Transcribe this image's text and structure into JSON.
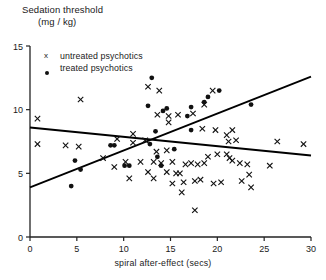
{
  "chart_data": {
    "type": "scatter",
    "title": "Sedation threshold (mg / kg)",
    "title_line1": "Sedation threshold",
    "title_line2": "(mg / kg)",
    "ylabel": "Sedation threshold (mg / kg)",
    "xlabel": "spiral after-effect (secs)",
    "xlim": [
      0,
      30
    ],
    "ylim": [
      0,
      15
    ],
    "xticks": [
      0,
      5,
      10,
      15,
      20,
      25,
      30
    ],
    "yticks": [
      0,
      5,
      10,
      15
    ],
    "xticklabels": [
      "0",
      "5",
      "10",
      "15",
      "20",
      "25",
      "30"
    ],
    "yticklabels": [
      "0",
      "5",
      "10",
      "15"
    ],
    "grid": false,
    "legend_position": "upper-left",
    "marker_color": "#111111",
    "line_color": "#000000",
    "series": [
      {
        "name": "untreated psychotics",
        "marker": "x",
        "points": [
          [
            0.8,
            9.3
          ],
          [
            0.8,
            7.3
          ],
          [
            5.4,
            10.8
          ],
          [
            3.8,
            7.2
          ],
          [
            5.2,
            7.1
          ],
          [
            9.3,
            7.7
          ],
          [
            11.0,
            8.1
          ],
          [
            11.0,
            7.4
          ],
          [
            7.8,
            6.2
          ],
          [
            9.0,
            5.5
          ],
          [
            12.6,
            11.8
          ],
          [
            13.8,
            11.5
          ],
          [
            13.6,
            9.6
          ],
          [
            14.8,
            9.5
          ],
          [
            14.8,
            9.0
          ],
          [
            15.8,
            9.6
          ],
          [
            17.4,
            9.7
          ],
          [
            18.6,
            10.4
          ],
          [
            19.5,
            11.5
          ],
          [
            18.4,
            8.5
          ],
          [
            12.3,
            7.6
          ],
          [
            13.5,
            6.7
          ],
          [
            14.6,
            6.8
          ],
          [
            13.2,
            5.9
          ],
          [
            14.0,
            5.8
          ],
          [
            15.2,
            5.9
          ],
          [
            16.6,
            5.7
          ],
          [
            17.2,
            5.8
          ],
          [
            17.9,
            5.7
          ],
          [
            18.6,
            5.8
          ],
          [
            19.8,
            8.4
          ],
          [
            21.0,
            8.0
          ],
          [
            21.6,
            8.4
          ],
          [
            21.2,
            7.5
          ],
          [
            22.0,
            7.6
          ],
          [
            21.0,
            6.5
          ],
          [
            21.3,
            6.2
          ],
          [
            21.6,
            6.0
          ],
          [
            22.4,
            5.8
          ],
          [
            20.0,
            6.5
          ],
          [
            19.0,
            6.3
          ],
          [
            23.2,
            5.7
          ],
          [
            25.6,
            5.6
          ],
          [
            26.4,
            7.5
          ],
          [
            29.2,
            7.3
          ],
          [
            10.6,
            4.6
          ],
          [
            13.2,
            4.6
          ],
          [
            15.2,
            4.2
          ],
          [
            16.4,
            4.3
          ],
          [
            17.6,
            4.4
          ],
          [
            16.2,
            3.5
          ],
          [
            18.2,
            4.5
          ],
          [
            19.6,
            4.2
          ],
          [
            16.0,
            5.0
          ],
          [
            23.4,
            4.9
          ],
          [
            23.6,
            3.9
          ],
          [
            17.6,
            2.1
          ],
          [
            20.4,
            4.3
          ],
          [
            22.6,
            4.4
          ],
          [
            14.6,
            5.1
          ],
          [
            15.6,
            5.0
          ],
          [
            11.8,
            5.9
          ],
          [
            12.6,
            5.1
          ],
          [
            10.2,
            5.9
          ]
        ]
      },
      {
        "name": "treated psychotics",
        "marker": "o",
        "points": [
          [
            4.8,
            6.0
          ],
          [
            5.4,
            5.3
          ],
          [
            8.6,
            7.2
          ],
          [
            12.6,
            10.3
          ],
          [
            13.0,
            12.5
          ],
          [
            14.2,
            9.9
          ],
          [
            14.6,
            10.1
          ],
          [
            16.8,
            9.5
          ],
          [
            17.2,
            10.2
          ],
          [
            18.6,
            10.6
          ],
          [
            19.0,
            11.0
          ],
          [
            20.2,
            11.5
          ],
          [
            17.2,
            8.4
          ],
          [
            13.4,
            8.3
          ],
          [
            12.8,
            7.3
          ],
          [
            9.0,
            7.2
          ],
          [
            15.4,
            6.9
          ],
          [
            13.6,
            6.3
          ],
          [
            14.0,
            5.6
          ],
          [
            10.1,
            5.6
          ],
          [
            10.6,
            5.6
          ],
          [
            23.6,
            10.4
          ],
          [
            4.4,
            4.0
          ]
        ]
      }
    ],
    "lines": [
      {
        "name": "treated-regression-rising",
        "x1": 0,
        "y1": 3.9,
        "x2": 30,
        "y2": 12.6
      },
      {
        "name": "untreated-regression-falling",
        "x1": 0,
        "y1": 8.6,
        "x2": 30,
        "y2": 6.4
      }
    ]
  },
  "legend": {
    "items": [
      {
        "mark": "x",
        "label": "untreated psychotics"
      },
      {
        "mark": "dot",
        "label": "treated psychotics"
      }
    ]
  }
}
